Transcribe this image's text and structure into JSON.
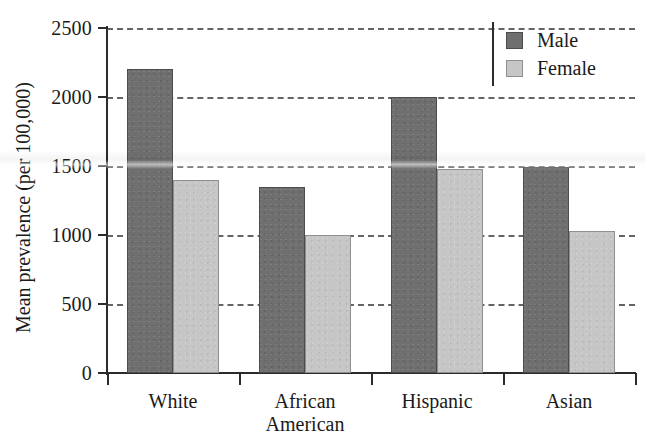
{
  "chart_data": {
    "type": "bar",
    "title": "",
    "subtitle": "",
    "xlabel": "",
    "ylabel": "Mean prevalence (per 100,000)",
    "categories": [
      "White",
      "African American",
      "Hispanic",
      "Asian"
    ],
    "category_lines": [
      [
        "White"
      ],
      [
        "African",
        "American"
      ],
      [
        "Hispanic"
      ],
      [
        "Asian"
      ]
    ],
    "series": [
      {
        "name": "Male",
        "color": "#6f6f6f",
        "values": [
          2200,
          1350,
          2000,
          1490
        ]
      },
      {
        "name": "Female",
        "color": "#c6c6c6",
        "values": [
          1400,
          1000,
          1480,
          1030
        ]
      }
    ],
    "ylim": [
      0,
      2500
    ],
    "yticks": [
      0,
      500,
      1000,
      1500,
      2000,
      2500
    ],
    "ytick_labels": [
      "0",
      "500",
      "1000",
      "1500",
      "2000",
      "2500"
    ],
    "grid": true,
    "grid_style": "dashed",
    "grid_axis": "y",
    "legend_position": "top-right",
    "legend_entries": [
      "Male",
      "Female"
    ],
    "bar_group_order": [
      "Male",
      "Female"
    ],
    "axis_color": "#2b2b2b",
    "background": "#ffffff"
  }
}
